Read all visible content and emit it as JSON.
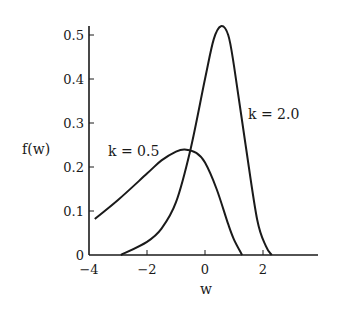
{
  "chart_data": {
    "type": "line",
    "title": "",
    "xlabel": "w",
    "ylabel": "f(w)",
    "xlim": [
      -4,
      4
    ],
    "ylim": [
      0,
      0.52
    ],
    "xticks": [
      -4,
      -2,
      0,
      2
    ],
    "xtick_labels": [
      "−4",
      "−2",
      "0",
      "2"
    ],
    "yticks": [
      0,
      0.1,
      0.2,
      0.3,
      0.4,
      0.5
    ],
    "ytick_labels": [
      "0",
      "0.1",
      "0.2",
      "0.3",
      "0.4",
      "0.5"
    ],
    "grid": false,
    "legend": "inline annotations",
    "series": [
      {
        "name": "k = 0.5",
        "x": [
          -3.8,
          -3.0,
          -2.0,
          -1.5,
          -1.0,
          -0.7,
          -0.3,
          0.0,
          0.4,
          0.8,
          1.0,
          1.28
        ],
        "y": [
          0.082,
          0.125,
          0.185,
          0.215,
          0.235,
          0.24,
          0.232,
          0.21,
          0.15,
          0.07,
          0.035,
          0.0
        ]
      },
      {
        "name": "k = 2.0",
        "x": [
          -2.9,
          -2.0,
          -1.5,
          -1.0,
          -0.5,
          0.0,
          0.3,
          0.55,
          0.8,
          1.0,
          1.4,
          1.8,
          2.1,
          2.3
        ],
        "y": [
          0.0,
          0.03,
          0.06,
          0.12,
          0.24,
          0.4,
          0.49,
          0.52,
          0.5,
          0.43,
          0.25,
          0.08,
          0.02,
          0.0
        ]
      }
    ],
    "annotations": [
      {
        "text": "k = 0.5",
        "x": -2.2,
        "y": 0.255
      },
      {
        "text": "k = 2.0",
        "x": 1.5,
        "y": 0.37
      }
    ]
  },
  "labels": {
    "xlabel": "w",
    "ylabel": "f(w)",
    "k05": "k = 0.5",
    "k20": "k = 2.0"
  }
}
